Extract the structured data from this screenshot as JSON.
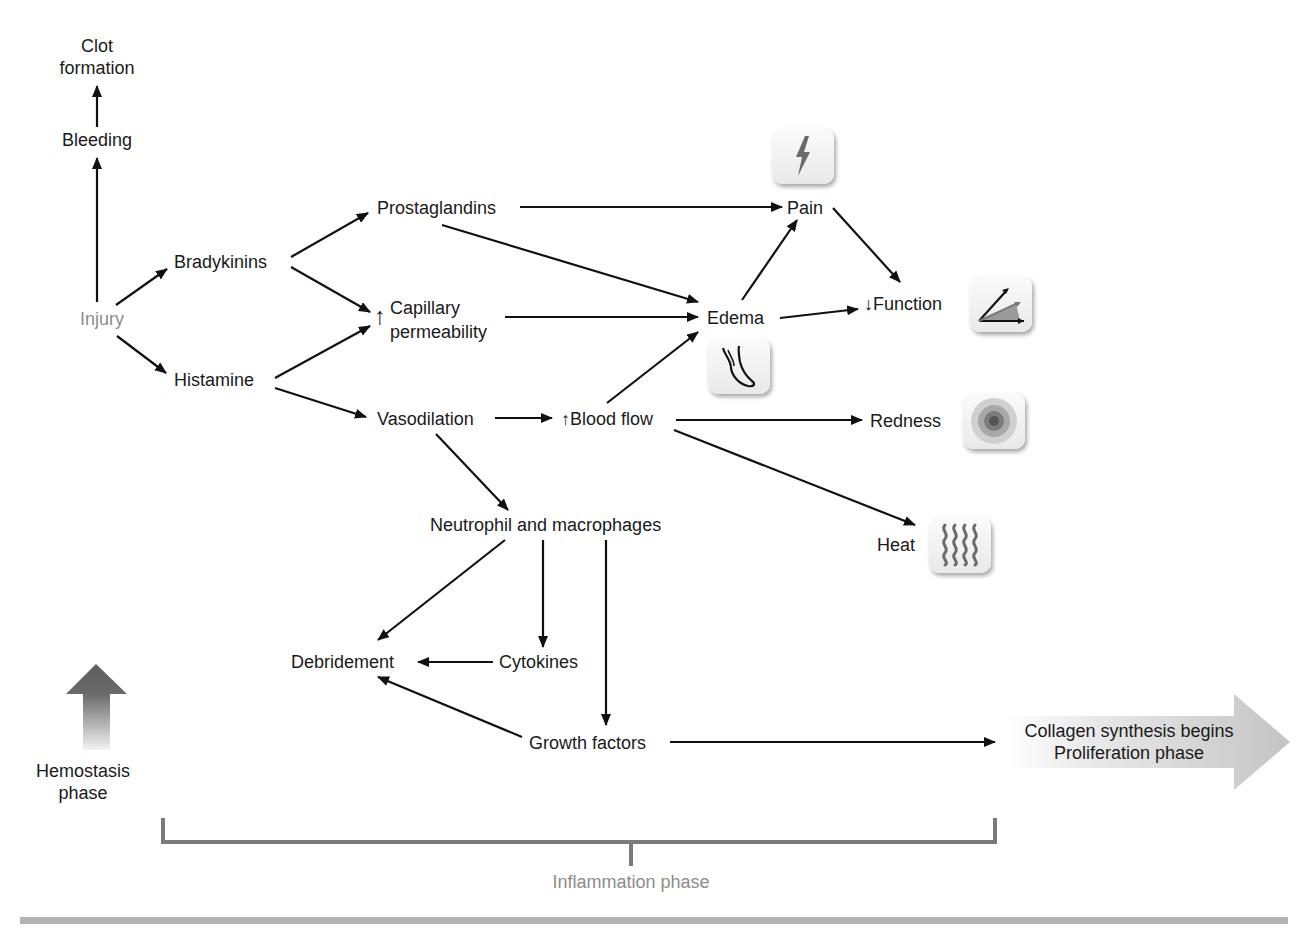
{
  "diagram": {
    "nodes": {
      "clot_formation": "Clot\nformation",
      "clot_line1": "Clot",
      "clot_line2": "formation",
      "bleeding": "Bleeding",
      "injury": "Injury",
      "bradykinins": "Bradykinins",
      "histamine": "Histamine",
      "prostaglandins": "Prostaglandins",
      "capillary_arrow": "↑",
      "capillary_line1": "Capillary",
      "capillary_line2": "permeability",
      "vasodilation": "Vasodilation",
      "blood_flow": "↑Blood flow",
      "pain": "Pain",
      "edema": "Edema",
      "function": "↓Function",
      "redness": "Redness",
      "heat": "Heat",
      "neutrophils": "Neutrophil and macrophages",
      "debridement": "Debridement",
      "cytokines": "Cytokines",
      "growth_factors": "Growth factors",
      "collagen_line1": "Collagen synthesis begins",
      "collagen_line2": "Proliferation phase"
    },
    "phases": {
      "hemostasis_line1": "Hemostasis",
      "hemostasis_line2": "phase",
      "inflammation": "Inflammation phase"
    },
    "icons": {
      "pain": "lightning-icon",
      "edema": "swollen-foot-icon",
      "function": "range-of-motion-icon",
      "redness": "concentric-circles-icon",
      "heat": "heat-waves-icon"
    },
    "edges": [
      [
        "Injury",
        "Bleeding"
      ],
      [
        "Bleeding",
        "Clot formation"
      ],
      [
        "Injury",
        "Bradykinins"
      ],
      [
        "Injury",
        "Histamine"
      ],
      [
        "Bradykinins",
        "Prostaglandins"
      ],
      [
        "Bradykinins",
        "Capillary permeability"
      ],
      [
        "Histamine",
        "Capillary permeability"
      ],
      [
        "Histamine",
        "Vasodilation"
      ],
      [
        "Prostaglandins",
        "Pain"
      ],
      [
        "Prostaglandins",
        "Edema"
      ],
      [
        "Capillary permeability",
        "Edema"
      ],
      [
        "Vasodilation",
        "Blood flow"
      ],
      [
        "Vasodilation",
        "Neutrophil and macrophages"
      ],
      [
        "Blood flow",
        "Edema"
      ],
      [
        "Blood flow",
        "Redness"
      ],
      [
        "Blood flow",
        "Heat"
      ],
      [
        "Edema",
        "Pain"
      ],
      [
        "Edema",
        "Function"
      ],
      [
        "Pain",
        "Function"
      ],
      [
        "Neutrophil and macrophages",
        "Debridement"
      ],
      [
        "Neutrophil and macrophages",
        "Cytokines"
      ],
      [
        "Neutrophil and macrophages",
        "Growth factors"
      ],
      [
        "Cytokines",
        "Debridement"
      ],
      [
        "Growth factors",
        "Debridement"
      ],
      [
        "Growth factors",
        "Collagen synthesis begins / Proliferation phase"
      ]
    ],
    "colors": {
      "text": "#1a1a1a",
      "muted_text": "#8c8c8c",
      "bracket": "#7a7a7a",
      "footer_bar": "#b3b3b3",
      "big_arrow_gray": "#c8c8c8",
      "hemostasis_arrow": "#666666"
    }
  }
}
